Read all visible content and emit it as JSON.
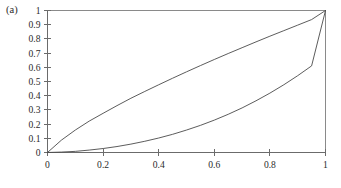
{
  "panel": {
    "label": "(a)"
  },
  "chart_data": {
    "type": "line",
    "title": "",
    "subtitle": "",
    "panel_label": "(a)",
    "xlabel": "",
    "ylabel": "",
    "xlim": [
      0,
      1
    ],
    "ylim": [
      0,
      1
    ],
    "grid": false,
    "legend": null,
    "legend_position": "none",
    "frame": "box",
    "line_color": "#4a4a4a",
    "axis_color": "#6b6b6b",
    "background_color": "#ffffff",
    "xticks": [
      0,
      0.2,
      0.4,
      0.6,
      0.8,
      1
    ],
    "xtick_labels": [
      "0",
      "0.2",
      "0.4",
      "0.6",
      "0.8",
      "1"
    ],
    "yticks": [
      0,
      0.1,
      0.2,
      0.3,
      0.4,
      0.5,
      0.6,
      0.7,
      0.8,
      0.9,
      1
    ],
    "ytick_labels": [
      "0",
      "0.1",
      "0.2",
      "0.3",
      "0.4",
      "0.5",
      "0.6",
      "0.7",
      "0.8",
      "0.9",
      "1"
    ],
    "x": [
      0,
      0.05,
      0.1,
      0.15,
      0.2,
      0.25,
      0.3,
      0.35,
      0.4,
      0.45,
      0.5,
      0.55,
      0.6,
      0.65,
      0.7,
      0.75,
      0.8,
      0.85,
      0.9,
      0.95,
      1
    ],
    "series": [
      {
        "name": "upper-curve",
        "values": [
          0,
          0.087,
          0.158,
          0.221,
          0.276,
          0.33,
          0.382,
          0.43,
          0.477,
          0.523,
          0.568,
          0.612,
          0.655,
          0.697,
          0.738,
          0.779,
          0.819,
          0.858,
          0.897,
          0.936,
          1
        ]
      },
      {
        "name": "lower-curve",
        "values": [
          0,
          0.003,
          0.008,
          0.017,
          0.028,
          0.042,
          0.059,
          0.079,
          0.102,
          0.128,
          0.158,
          0.191,
          0.228,
          0.269,
          0.314,
          0.364,
          0.418,
          0.477,
          0.541,
          0.61,
          1
        ]
      }
    ]
  }
}
